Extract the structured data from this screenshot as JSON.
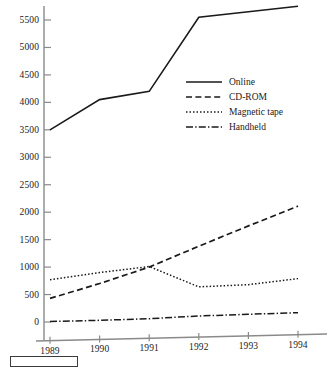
{
  "chart_data": {
    "type": "line",
    "title": "",
    "subtitle": "",
    "xlabel": "",
    "ylabel": "",
    "categories": [
      "1989",
      "1990",
      "1991",
      "1992",
      "1993",
      "1994"
    ],
    "x": [
      1989,
      1990,
      1991,
      1992,
      1993,
      1994
    ],
    "xlim": [
      1988.6,
      1994.6
    ],
    "ylim": [
      0,
      5800
    ],
    "y_ticks": [
      0,
      500,
      1000,
      1500,
      2000,
      2500,
      3000,
      3500,
      4000,
      4500,
      5000,
      5500
    ],
    "y_tick_labels": [
      "0",
      "500",
      "1000",
      "1500",
      "2000",
      "2500",
      "3000",
      "3500",
      "4000",
      "4500",
      "5000",
      "5500"
    ],
    "x_ticks": [
      1989,
      1990,
      1991,
      1992,
      1993,
      1994
    ],
    "x_tick_labels": [
      "1989",
      "1990",
      "1991",
      "1992",
      "1993",
      "1994"
    ],
    "grid": false,
    "legend_position": "center-right",
    "series": [
      {
        "name": "Online",
        "style": "solid",
        "color": "#1a1a1a",
        "values": [
          3500,
          4050,
          4200,
          5550,
          5650,
          5750
        ]
      },
      {
        "name": "CD-ROM",
        "style": "dashed",
        "color": "#1a1a1a",
        "values": [
          430,
          700,
          1000,
          1380,
          1750,
          2110
        ]
      },
      {
        "name": "Magnetic tape",
        "style": "dotted",
        "color": "#1a1a1a",
        "values": [
          770,
          900,
          1010,
          640,
          680,
          790
        ]
      },
      {
        "name": "Handheld",
        "style": "dashdot",
        "color": "#1a1a1a",
        "values": [
          10,
          30,
          60,
          110,
          140,
          170
        ]
      }
    ]
  },
  "legend": {
    "items": [
      {
        "label": "Online",
        "style": "solid"
      },
      {
        "label": "CD-ROM",
        "style": "dashed"
      },
      {
        "label": "Magnetic tape",
        "style": "dotted"
      },
      {
        "label": "Handheld",
        "style": "dashdot"
      }
    ]
  },
  "axes": {
    "y_axis_color": "#8a8a8a",
    "x_axis_color": "#8a8a8a",
    "line_color": "#1a1a1a"
  }
}
